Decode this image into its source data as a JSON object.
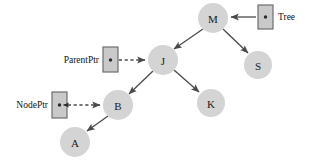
{
  "diagram": {
    "type": "binary-search-tree-with-pointers",
    "width": 309,
    "height": 167,
    "background_color": "#ffffff",
    "node_fill_color": "#d4d4d4",
    "edge_color": "#4a4a4a",
    "box_fill_color": "#c9c9c9",
    "box_border_color": "#6e6e6e",
    "nodes": [
      {
        "id": "M",
        "label": "M",
        "cx": 213,
        "cy": 18,
        "r": 15
      },
      {
        "id": "S",
        "label": "S",
        "cx": 258,
        "cy": 65,
        "r": 14
      },
      {
        "id": "J",
        "label": "J",
        "cx": 163,
        "cy": 60,
        "r": 15
      },
      {
        "id": "B",
        "label": "B",
        "cx": 118,
        "cy": 105,
        "r": 15
      },
      {
        "id": "K",
        "label": "K",
        "cx": 211,
        "cy": 103,
        "r": 14
      },
      {
        "id": "A",
        "label": "A",
        "cx": 75,
        "cy": 142,
        "r": 15
      }
    ],
    "edges": [
      {
        "id": "m-j",
        "from": "M",
        "to": "J",
        "style": "solid",
        "x1": 203,
        "y1": 29,
        "x2": 173,
        "y2": 50
      },
      {
        "id": "m-s",
        "from": "M",
        "to": "S",
        "style": "solid",
        "x1": 223,
        "y1": 29,
        "x2": 249,
        "y2": 54
      },
      {
        "id": "j-b",
        "from": "J",
        "to": "B",
        "style": "solid",
        "x1": 153,
        "y1": 71,
        "x2": 128,
        "y2": 95
      },
      {
        "id": "j-k",
        "from": "J",
        "to": "K",
        "style": "solid",
        "x1": 174,
        "y1": 70,
        "x2": 200,
        "y2": 93
      },
      {
        "id": "b-a",
        "from": "B",
        "to": "A",
        "style": "solid",
        "x1": 108,
        "y1": 116,
        "x2": 86,
        "y2": 132
      }
    ],
    "pointers": [
      {
        "id": "tree",
        "label": "Tree",
        "label_side": "right",
        "label_x": 278,
        "label_y": 17,
        "box_x": 258,
        "box_y": 5,
        "box_w": 15,
        "box_h": 24,
        "dot_cx": 265.5,
        "dot_cy": 17,
        "arrow_style": "solid",
        "arrow_x1": 256,
        "arrow_y1": 17,
        "arrow_x2": 231,
        "arrow_y2": 17,
        "target": "M"
      },
      {
        "id": "parentptr",
        "label": "ParentPtr",
        "label_side": "left",
        "label_x": 99,
        "label_y": 60,
        "box_x": 103,
        "box_y": 47,
        "box_w": 15,
        "box_h": 25,
        "dot_cx": 110.5,
        "dot_cy": 60,
        "arrow_style": "dashed",
        "arrow_x1": 112,
        "arrow_y1": 60,
        "arrow_x2": 145,
        "arrow_y2": 60,
        "target": "J"
      },
      {
        "id": "nodeptr",
        "label": "NodePtr",
        "label_side": "left",
        "label_x": 48,
        "label_y": 105,
        "box_x": 52,
        "box_y": 92,
        "box_w": 15,
        "box_h": 26,
        "dot_cx": 59.5,
        "dot_cy": 105,
        "arrow_style": "dashed",
        "arrow_x1": 61,
        "arrow_y1": 105,
        "arrow_x2": 100,
        "arrow_y2": 105,
        "target": "B",
        "inner_arrow": {
          "x1": 68,
          "y1": 105,
          "x2": 62,
          "y2": 105
        }
      }
    ]
  }
}
